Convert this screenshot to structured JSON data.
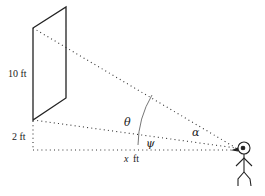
{
  "figure": {
    "type": "geometry diagram",
    "labels": {
      "board_height": "10 ft",
      "board_offset": "2 ft",
      "distance": "ft",
      "distance_var": "x",
      "theta": "θ",
      "psi": "ψ",
      "alpha": "α"
    },
    "colors": {
      "stroke": "#222222",
      "dotted": "#333333",
      "arc": "#777777",
      "background": "#ffffff"
    }
  }
}
